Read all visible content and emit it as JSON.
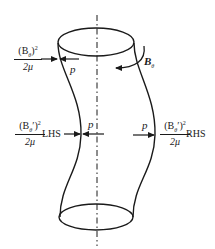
{
  "diagram": {
    "colors": {
      "stroke": "#1a1a1a",
      "background": "#ffffff"
    },
    "top_label": {
      "numerator": "(B",
      "numerator_sub": "θ",
      "numerator_close": ")",
      "numerator_sup": "2",
      "denominator": "2μ",
      "pressure": "p"
    },
    "field_label": {
      "symbol": "B",
      "sub": "θ"
    },
    "left_label": {
      "numerator": "(B",
      "numerator_sub": "θ",
      "numerator_prime": "′",
      "numerator_close": ")",
      "numerator_sup": "2",
      "denominator": "2μ",
      "side": "LHS",
      "pressure": "p"
    },
    "right_label": {
      "numerator": "(B",
      "numerator_sub": "θ",
      "numerator_prime": "′",
      "numerator_close": ")",
      "numerator_sup": "2",
      "denominator": "2μ",
      "side": "RHS",
      "pressure": "p"
    }
  }
}
